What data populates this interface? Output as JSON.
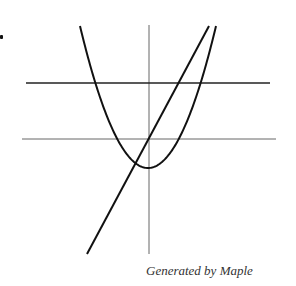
{
  "caption": "Generated by Maple",
  "colors": {
    "curve": "#111111",
    "axis": "#555555",
    "background": "#ffffff"
  },
  "chart_data": {
    "type": "line",
    "title": "",
    "xlabel": "",
    "ylabel": "",
    "grid": false,
    "legend": null,
    "annotations": [
      "Generated by Maple"
    ],
    "series": [
      {
        "name": "parabola",
        "kind": "quadratic",
        "description": "upward-opening parabola, vertex slightly below x-axis near y-axis",
        "points_px": [
          [
            80,
            26
          ],
          [
            95,
            75
          ],
          [
            110,
            115
          ],
          [
            125,
            148
          ],
          [
            140,
            166
          ],
          [
            148,
            168
          ],
          [
            158,
            166
          ],
          [
            172,
            150
          ],
          [
            186,
            120
          ],
          [
            200,
            80
          ],
          [
            216,
            26
          ]
        ]
      },
      {
        "name": "line",
        "kind": "linear",
        "description": "steep increasing line crossing near origin",
        "points_px": [
          [
            87,
            254
          ],
          [
            209,
            26
          ]
        ]
      },
      {
        "name": "horizontal-line",
        "kind": "constant",
        "description": "horizontal line above x-axis",
        "points_px": [
          [
            26,
            83
          ],
          [
            270,
            83
          ]
        ]
      }
    ],
    "axes_px": {
      "x_axis_y": 139,
      "x_range": [
        22,
        276
      ],
      "y_axis_x": 149,
      "y_range": [
        25,
        254
      ]
    }
  }
}
